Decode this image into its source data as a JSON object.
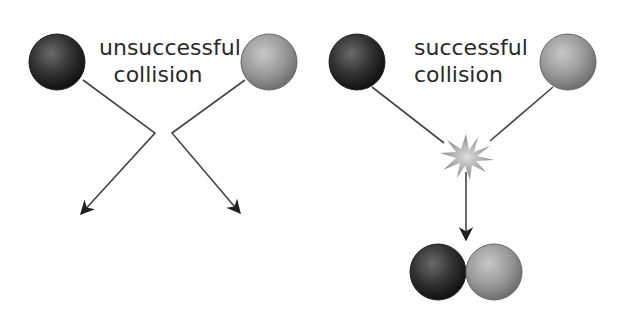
{
  "diagram": {
    "left_panel": {
      "label_line1": "unsuccessful",
      "label_line2": "collision",
      "particles": [
        {
          "name": "dark-particle",
          "color": "#2b2b2b"
        },
        {
          "name": "grey-particle",
          "color": "#9a9a9a"
        }
      ],
      "outcome": "particles bounce apart"
    },
    "right_panel": {
      "label_line1": "successful",
      "label_line2": "collision",
      "particles": [
        {
          "name": "dark-particle",
          "color": "#2b2b2b"
        },
        {
          "name": "grey-particle",
          "color": "#9a9a9a"
        }
      ],
      "collision_marker": "starburst-icon",
      "outcome": "particles combine"
    },
    "colors": {
      "line": "#444444",
      "dark_ball": "#2b2b2b",
      "light_ball": "#9a9a9a",
      "starburst": "#a8a8a8"
    }
  }
}
